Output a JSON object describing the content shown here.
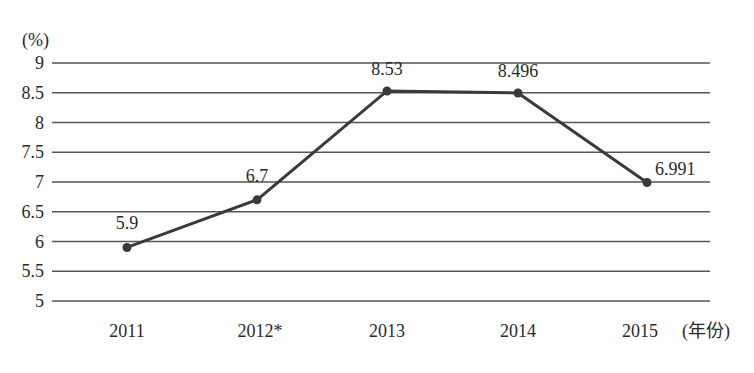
{
  "chart_data": {
    "type": "line",
    "title": "",
    "xlabel": "(年份)",
    "ylabel": "(%)",
    "categories": [
      "2011",
      "2012*",
      "2013",
      "2014",
      "2015"
    ],
    "series": [
      {
        "name": "",
        "values": [
          5.9,
          6.7,
          8.53,
          8.496,
          6.991
        ]
      }
    ],
    "data_labels": [
      "5.9",
      "6.7",
      "8.53",
      "8.496",
      "6.991"
    ],
    "yticks": [
      "5",
      "5.5",
      "6",
      "6.5",
      "7",
      "7.5",
      "8",
      "8.5",
      "9"
    ],
    "ylim": [
      5,
      9
    ],
    "grid": true,
    "legend": "none",
    "colors": {
      "line": "#3a3a3a",
      "grid": "#555555",
      "text": "#2a2a2a"
    }
  }
}
